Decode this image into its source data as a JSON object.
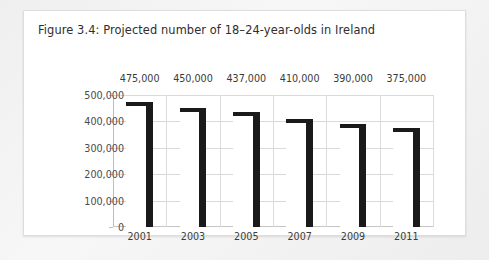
{
  "figure": {
    "title": "Figure 3.4: Projected number of 18–24-year-olds in Ireland"
  },
  "chart_data": {
    "type": "bar",
    "title": "Figure 3.4: Projected number of 18–24-year-olds in Ireland",
    "xlabel": "",
    "ylabel": "",
    "categories": [
      "2001",
      "2003",
      "2005",
      "2007",
      "2009",
      "2011"
    ],
    "values": [
      475000,
      450000,
      437000,
      410000,
      390000,
      375000
    ],
    "data_labels": [
      "475,000",
      "450,000",
      "437,000",
      "410,000",
      "390,000",
      "375,000"
    ],
    "ylim": [
      0,
      500000
    ],
    "yticks": [
      0,
      100000,
      200000,
      300000,
      400000,
      500000
    ],
    "ytick_labels": [
      "0",
      "100,000",
      "200,000",
      "300,000",
      "400,000",
      "500,000"
    ],
    "grid": true,
    "legend": false,
    "legend_position": "none",
    "series": [
      {
        "name": "Projected 18–24-year-olds",
        "values": [
          475000,
          450000,
          437000,
          410000,
          390000,
          375000
        ]
      }
    ],
    "colors": {
      "bar": "#1a1a1a",
      "bar_face": "#ffffff",
      "gridline": "#d9d9d9",
      "axis": "#bdbdbd",
      "text": "#3a3a3a",
      "card_background": "#ffffff",
      "page_background": "#f2f2f2"
    }
  }
}
